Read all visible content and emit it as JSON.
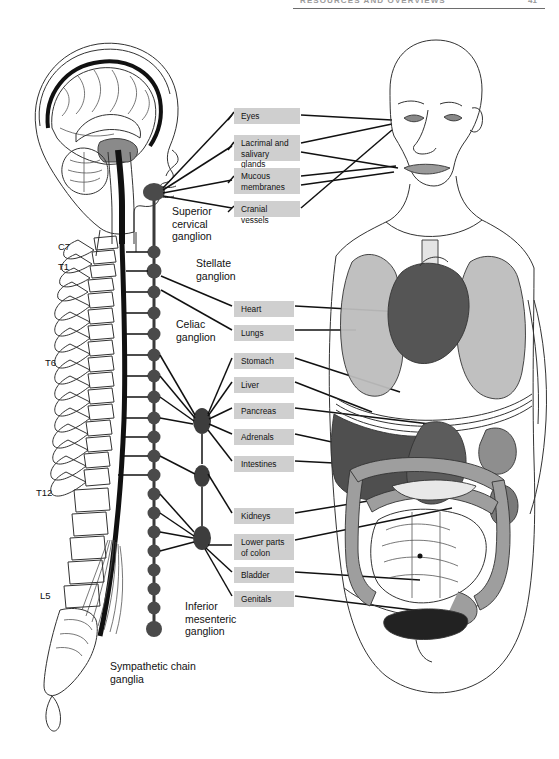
{
  "page": {
    "header_title": "RESOURCES AND OVERVIEWS",
    "page_number": "41"
  },
  "figure": {
    "left_panel_name": "spinal-cord-and-sympathetic-chain",
    "right_panel_name": "body-with-target-organs"
  },
  "vertebral_levels": [
    {
      "label": "C7",
      "x": 58,
      "y": 247
    },
    {
      "label": "T1",
      "x": 58,
      "y": 266
    },
    {
      "label": "T6",
      "x": 45,
      "y": 362
    },
    {
      "label": "T12",
      "x": 37,
      "y": 492
    },
    {
      "label": "L5",
      "x": 40,
      "y": 595
    }
  ],
  "ganglion_labels": [
    {
      "name": "superior-cervical-ganglion",
      "text": "Superior\ncervical\nganglion",
      "x": 172,
      "y": 210
    },
    {
      "name": "stellate-ganglion",
      "text": "Stellate\nganglion",
      "x": 196,
      "y": 262
    },
    {
      "name": "celiac-ganglion",
      "text": "Celiac\nganglion",
      "x": 176,
      "y": 323
    },
    {
      "name": "inferior-mesenteric-ganglion",
      "text": "Inferior\nmesenteric\nganglion",
      "x": 185,
      "y": 604
    },
    {
      "name": "sympathetic-chain-ganglia",
      "text": "Sympathetic chain\nganglia",
      "x": 110,
      "y": 665
    }
  ],
  "target_organ_labels": [
    {
      "name": "eyes",
      "text": "Eyes",
      "x": 234,
      "y": 108,
      "w": 66,
      "h": 16
    },
    {
      "name": "lacrimal-and-salivary-glands",
      "text": "Lacrimal and\nsalivary glands",
      "x": 234,
      "y": 135,
      "w": 66,
      "h": 26
    },
    {
      "name": "mucous-membranes",
      "text": "Mucous\nmembranes",
      "x": 234,
      "y": 168,
      "w": 66,
      "h": 26
    },
    {
      "name": "cranial-vessels",
      "text": "Cranial vessels",
      "x": 234,
      "y": 201,
      "w": 66,
      "h": 16
    },
    {
      "name": "heart",
      "text": "Heart",
      "x": 234,
      "y": 301,
      "w": 60,
      "h": 16
    },
    {
      "name": "lungs",
      "text": "Lungs",
      "x": 234,
      "y": 325,
      "w": 60,
      "h": 16
    },
    {
      "name": "stomach",
      "text": "Stomach",
      "x": 234,
      "y": 353,
      "w": 60,
      "h": 16
    },
    {
      "name": "liver",
      "text": "Liver",
      "x": 234,
      "y": 377,
      "w": 60,
      "h": 16
    },
    {
      "name": "pancreas",
      "text": "Pancreas",
      "x": 234,
      "y": 403,
      "w": 60,
      "h": 16
    },
    {
      "name": "adrenals",
      "text": "Adrenals",
      "x": 234,
      "y": 429,
      "w": 60,
      "h": 16
    },
    {
      "name": "intestines",
      "text": "Intestines",
      "x": 234,
      "y": 456,
      "w": 60,
      "h": 16
    },
    {
      "name": "kidneys",
      "text": "Kidneys",
      "x": 234,
      "y": 508,
      "w": 60,
      "h": 16
    },
    {
      "name": "lower-parts-of-colon",
      "text": "Lower parts\nof colon",
      "x": 234,
      "y": 534,
      "w": 60,
      "h": 26
    },
    {
      "name": "bladder",
      "text": "Bladder",
      "x": 234,
      "y": 567,
      "w": 60,
      "h": 16
    },
    {
      "name": "genitals",
      "text": "Genitals",
      "x": 234,
      "y": 591,
      "w": 60,
      "h": 16
    }
  ],
  "colors": {
    "chip_background": "#cfcfcf",
    "outline": "#333333",
    "chain_ganglion": "#4a4a4a",
    "lung": "#bdbdbd",
    "heart": "#555555",
    "liver": "#4f4f4f",
    "colon": "#9e9e9e",
    "bladder": "#222222",
    "brainstem": "#8a8a8a"
  }
}
